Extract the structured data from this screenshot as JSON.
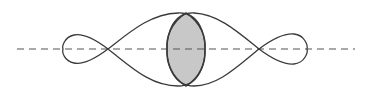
{
  "diagram": {
    "colors": {
      "background": "#ffffff",
      "stroke": "#3a3a3a",
      "axis": "#555555",
      "overlap_fill": "#c8c8c8"
    },
    "labels": []
  }
}
